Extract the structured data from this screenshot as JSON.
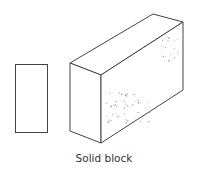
{
  "caption": "Solid block",
  "colors": {
    "outline": "#444444",
    "speckle": "#9a9a9a",
    "background": "#ffffff"
  },
  "figure": {
    "elements": [
      "end-view-rectangle",
      "isometric-block"
    ],
    "texture": "speckled concrete"
  }
}
